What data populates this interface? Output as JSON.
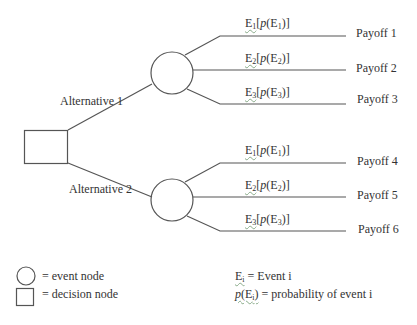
{
  "diagram": {
    "type": "decision-tree",
    "decision_node": {
      "shape": "square"
    },
    "alternatives": [
      {
        "label": "Alternative 1",
        "branches": [
          {
            "event": "E",
            "sub": "1",
            "prob_fn": "p",
            "payoff": "Payoff 1"
          },
          {
            "event": "E",
            "sub": "2",
            "prob_fn": "p",
            "payoff": "Payoff 2"
          },
          {
            "event": "E",
            "sub": "3",
            "prob_fn": "p",
            "payoff": "Payoff 3"
          }
        ]
      },
      {
        "label": "Alternative 2",
        "branches": [
          {
            "event": "E",
            "sub": "1",
            "prob_fn": "p",
            "payoff": "Payoff 4"
          },
          {
            "event": "E",
            "sub": "2",
            "prob_fn": "p",
            "payoff": "Payoff 5"
          },
          {
            "event": "E",
            "sub": "3",
            "prob_fn": "p",
            "payoff": "Payoff 6"
          }
        ]
      }
    ],
    "legend": {
      "event_node": "= event node",
      "decision_node": "= decision node",
      "event_def_symbol": "E",
      "event_def_sub": "i",
      "event_def_text": "= Event i",
      "prob_def_fn": "p",
      "prob_def_symbol": "(E",
      "prob_def_sub": "i",
      "prob_def_close": ")",
      "prob_def_text": "= probability of event i"
    },
    "colors": {
      "line": "#555555",
      "text": "#333333",
      "background": "#ffffff"
    }
  }
}
